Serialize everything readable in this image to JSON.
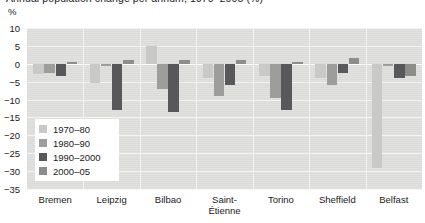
{
  "chart_data": {
    "type": "bar",
    "title": "Annual population change per annum, 1970–2005 (%)",
    "unit_label": "%",
    "xlabel": "",
    "ylabel": "",
    "ylim": [
      -35,
      10
    ],
    "ytick_values": [
      10,
      5,
      0,
      -5,
      -10,
      -15,
      -20,
      -25,
      -30,
      -35
    ],
    "ytick_labels": [
      "10",
      "5",
      "0",
      "−5",
      "−10",
      "−15",
      "−20",
      "−25",
      "−30",
      "−35"
    ],
    "grid": true,
    "legend_position": "inside-left",
    "categories": [
      "Bremen",
      "Leipzig",
      "Bilbao",
      "Saint-Étienne",
      "Torino",
      "Sheffield",
      "Belfast"
    ],
    "series": [
      {
        "name": "1970–80",
        "color": "#c9c9c7",
        "values": [
          -3.0,
          -5.5,
          5.0,
          -4.0,
          -3.5,
          -4.0,
          -29.0
        ]
      },
      {
        "name": "1980–90",
        "color": "#9d9d9b",
        "values": [
          -2.5,
          -0.5,
          -7.0,
          -9.0,
          -9.5,
          -6.0,
          -0.5
        ]
      },
      {
        "name": "1990–2000",
        "color": "#58585a",
        "values": [
          -3.5,
          -13.0,
          -13.5,
          -6.0,
          -13.0,
          -2.5,
          -4.0
        ]
      },
      {
        "name": "2000–05",
        "color": "#8d8d8b",
        "values": [
          0.5,
          1.0,
          1.0,
          1.0,
          0.5,
          1.5,
          -3.5
        ]
      }
    ]
  },
  "colors": {
    "plot_background": "#dededd",
    "gridline": "#f4f4f3",
    "text": "#1a1a1a",
    "legend_background": "#ffffff"
  }
}
